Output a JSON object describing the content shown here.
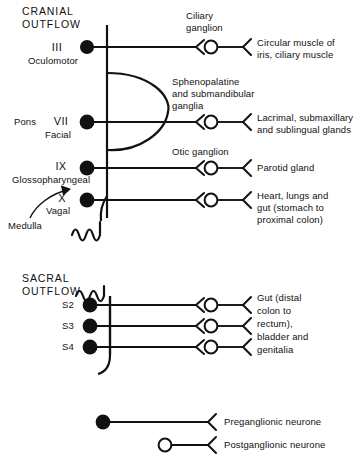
{
  "figure": {
    "title_visible": false,
    "colors": {
      "ink": "#111111",
      "background": "#ffffff",
      "preganglionic_fill": "#111111",
      "postganglionic_fill": "#ffffff"
    }
  },
  "sections": [
    {
      "id": "cranial",
      "line1": "CRANIAL",
      "line2": "OUTFLOW"
    },
    {
      "id": "sacral",
      "line1": "SACRAL",
      "line2": "OUTFLOW"
    }
  ],
  "cranial": {
    "region_labels": [
      {
        "name": "pons",
        "text": "Pons"
      },
      {
        "name": "medulla",
        "text": "Medulla"
      }
    ],
    "nerves": [
      {
        "roman": "III",
        "name": "Oculomotor",
        "ganglion": "Ciliary\nganglion",
        "target": "Circular muscle of\niris, ciliary muscle"
      },
      {
        "roman": "VII",
        "name": "Facial",
        "ganglion": "Sphenopalatine\nand submandibular\nganglia",
        "target": "Lacrimal, submaxillary\nand sublingual glands"
      },
      {
        "roman": "IX",
        "name": "Glossopharyngeal",
        "ganglion": "Otic ganglion",
        "target": "Parotid gland"
      },
      {
        "roman": "X",
        "name": "Vagal",
        "ganglion": "",
        "target": "Heart, lungs and\ngut (stomach to\nproximal colon)"
      }
    ]
  },
  "sacral": {
    "segments": [
      "S2",
      "S3",
      "S4"
    ],
    "target": "Gut (distal\ncolon to\nrectum),\nbladder and\ngenitalia"
  },
  "legend": [
    {
      "key": "preganglionic",
      "label": "Preganglionic neurone",
      "marker": "filled-circle"
    },
    {
      "key": "postganglionic",
      "label": "Postganglionic neurone",
      "marker": "open-circle"
    }
  ],
  "text_blocks": {
    "cranial_head_1": "CRANIAL",
    "cranial_head_2": "OUTFLOW",
    "sacral_head_1": "SACRAL",
    "sacral_head_2": "OUTFLOW",
    "pons": "Pons",
    "medulla": "Medulla",
    "roman_3": "III",
    "roman_7": "VII",
    "roman_9": "IX",
    "roman_10": "X",
    "name_3": "Oculomotor",
    "name_7": "Facial",
    "name_9": "Glossopharyngeal",
    "name_10": "Vagal",
    "ciliary_1": "Ciliary",
    "ciliary_2": "ganglion",
    "spheno_1": "Sphenopalatine",
    "spheno_2": "and submandibular",
    "spheno_3": "ganglia",
    "otic": "Otic ganglion",
    "t3_1": "Circular muscle of",
    "t3_2": "iris, ciliary muscle",
    "t7_1": "Lacrimal, submaxillary",
    "t7_2": "and sublingual glands",
    "t9_1": "Parotid gland",
    "t10_1": "Heart, lungs and",
    "t10_2": "gut (stomach to",
    "t10_3": "proximal colon)",
    "s2": "S2",
    "s3": "S3",
    "s4": "S4",
    "ts_1": "Gut (distal",
    "ts_2": "colon to",
    "ts_3": "rectum),",
    "ts_4": "bladder and",
    "ts_5": "genitalia",
    "legend_pre": "Preganglionic neurone",
    "legend_post": "Postganglionic neurone"
  }
}
